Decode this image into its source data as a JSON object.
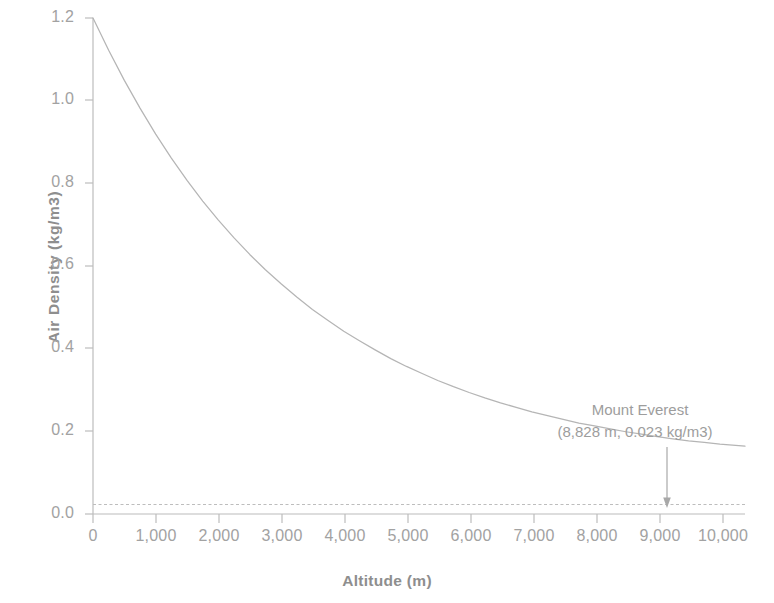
{
  "figure": {
    "background": "#ffffff",
    "ink_color": "#9a9a9a"
  },
  "axes": {
    "x_title": "Altitude (m)",
    "y_title": "Air Density (kg/m3)",
    "x_tick_labels": [
      "0",
      "1,000",
      "2,000",
      "3,000",
      "4,000",
      "5,000",
      "6,000",
      "7,000",
      "8,000",
      "9,000",
      "10,000"
    ],
    "y_tick_labels": [
      "0.0",
      "0.2",
      "0.4",
      "0.6",
      "0.8",
      "1.0",
      "1.2"
    ]
  },
  "annotation": {
    "line1": "Mount Everest",
    "line2": "(8,828 m, 0.023 kg/m3)"
  },
  "chart_data": {
    "type": "line",
    "title": "",
    "subtitle": "",
    "xlabel": "Altitude (m)",
    "ylabel": "Air Density (kg/m3)",
    "xlim": [
      0,
      10400
    ],
    "ylim": [
      0,
      1.2
    ],
    "xticks": [
      0,
      1000,
      2000,
      3000,
      4000,
      5000,
      6000,
      7000,
      8000,
      9000,
      10000
    ],
    "xticklabels": [
      "0",
      "1,000",
      "2,000",
      "3,000",
      "4,000",
      "5,000",
      "6,000",
      "7,000",
      "8,000",
      "9,000",
      "10,000"
    ],
    "yticks": [
      0.0,
      0.2,
      0.4,
      0.6,
      0.8,
      1.0,
      1.2
    ],
    "yticklabels": [
      "0.0",
      "0.2",
      "0.4",
      "0.6",
      "0.8",
      "1.0",
      "1.2"
    ],
    "grid": false,
    "legend": "none",
    "line_color": "#b5b5b5",
    "series": [
      {
        "name": "Air density vs altitude",
        "x": [
          0,
          250,
          500,
          750,
          1000,
          1250,
          1500,
          1750,
          2000,
          2250,
          2500,
          2750,
          3000,
          3250,
          3500,
          3750,
          4000,
          4250,
          4500,
          4750,
          5000,
          5250,
          5500,
          5750,
          6000,
          6250,
          6500,
          6750,
          7000,
          7250,
          7500,
          7750,
          8000,
          8250,
          8500,
          8750,
          9000,
          9250,
          9500,
          9750,
          10000,
          10400
        ],
        "values": [
          1.2,
          1.122,
          1.049,
          0.982,
          0.919,
          0.861,
          0.807,
          0.757,
          0.711,
          0.668,
          0.628,
          0.591,
          0.557,
          0.525,
          0.495,
          0.468,
          0.442,
          0.419,
          0.397,
          0.376,
          0.357,
          0.34,
          0.323,
          0.308,
          0.294,
          0.281,
          0.269,
          0.258,
          0.247,
          0.238,
          0.229,
          0.22,
          0.213,
          0.206,
          0.199,
          0.193,
          0.187,
          0.182,
          0.177,
          0.173,
          0.169,
          0.164
        ]
      }
    ],
    "reference_line": {
      "name": "Mount Everest air density",
      "orientation": "horizontal",
      "value": 0.023,
      "style": "dashed",
      "color": "#bdbdbd"
    },
    "annotations": [
      {
        "text": "Mount Everest\n(8,828 m, 0.023 kg/m3)",
        "point_x": 9000,
        "point_y": 0.023,
        "arrow": "down"
      }
    ]
  }
}
